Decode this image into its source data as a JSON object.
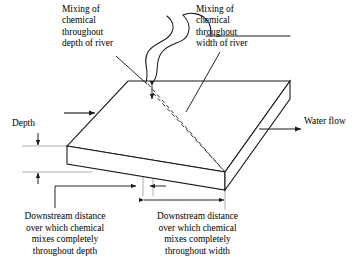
{
  "diagram": {
    "background_color": "#ffffff",
    "line_color": "#1a1a1a",
    "guide_color": "#9a9a9a",
    "labels": {
      "mixing_depth": "Mixing of\nchemical\nthroughout\ndepth of river",
      "mixing_width": "Mixing of\nchemical\nthroughout\nwidth of river",
      "depth": "Depth",
      "water_flow": "Water flow"
    },
    "captions": {
      "downstream_depth": "Downstream distance\nover which chemical\nmixes completely\nthroughout depth",
      "downstream_width": "Downstream distance\nover which chemical\nmixes completely\nthroughout width"
    },
    "icons": {
      "flow_arrow_upstream": "arrow-right-icon",
      "flow_arrow_downstream": "arrow-right-icon",
      "depth_dimension": "double-arrow-vertical-icon",
      "plume_dimension": "double-arrow-vertical-icon",
      "distance_depth_dimension": "arrow-right-icon",
      "distance_width_dimension": "double-arrow-horizontal-icon",
      "river_channel": "river-squiggle-icon",
      "slab": "river-slab-3d-icon",
      "plume_depth": "dashed-plume-line-icon",
      "plume_width": "dashed-plume-line-icon"
    }
  }
}
